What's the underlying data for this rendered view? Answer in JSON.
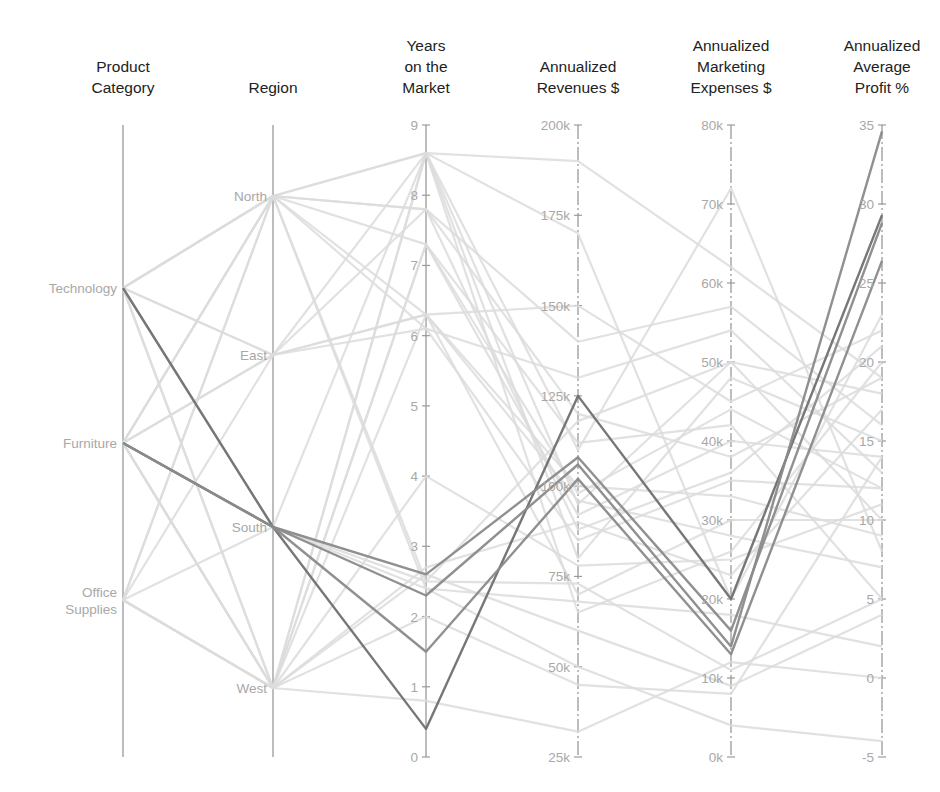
{
  "chart_data": {
    "type": "parallel_coordinates",
    "title": "",
    "axes": [
      {
        "key": "category",
        "label": "Product Category",
        "label_lines": [
          "Product",
          "Category"
        ],
        "kind": "categorical",
        "x": 123,
        "categories": [
          {
            "name": "Technology",
            "lines": [
              "Technology"
            ],
            "y": 288
          },
          {
            "name": "Furniture",
            "lines": [
              "Furniture"
            ],
            "y": 443
          },
          {
            "name": "Office Supplies",
            "lines": [
              "Office",
              "Supplies"
            ],
            "y": 600
          }
        ]
      },
      {
        "key": "region",
        "label": "Region",
        "label_lines": [
          "Region"
        ],
        "kind": "categorical",
        "x": 273,
        "categories": [
          {
            "name": "North",
            "lines": [
              "North"
            ],
            "y": 196
          },
          {
            "name": "East",
            "lines": [
              "East"
            ],
            "y": 355
          },
          {
            "name": "South",
            "lines": [
              "South"
            ],
            "y": 527
          },
          {
            "name": "West",
            "lines": [
              "West"
            ],
            "y": 688
          }
        ]
      },
      {
        "key": "years",
        "label": "Years on the Market",
        "label_lines": [
          "Years",
          "on the",
          "Market"
        ],
        "kind": "numeric",
        "x": 426,
        "range": [
          0,
          9
        ],
        "ticks": [
          {
            "v": 0,
            "t": "0"
          },
          {
            "v": 1,
            "t": "1"
          },
          {
            "v": 2,
            "t": "2"
          },
          {
            "v": 3,
            "t": "3"
          },
          {
            "v": 4,
            "t": "4"
          },
          {
            "v": 5,
            "t": "5"
          },
          {
            "v": 6,
            "t": "6"
          },
          {
            "v": 7,
            "t": "7"
          },
          {
            "v": 8,
            "t": "8"
          },
          {
            "v": 9,
            "t": "9"
          }
        ]
      },
      {
        "key": "revenue",
        "label": "Annualized Revenues $",
        "label_lines": [
          "Annualized",
          "Revenues $"
        ],
        "kind": "numeric",
        "x": 578,
        "range": [
          25000,
          200000
        ],
        "ticks": [
          {
            "v": 25000,
            "t": "25k"
          },
          {
            "v": 50000,
            "t": "50k"
          },
          {
            "v": 75000,
            "t": "75k"
          },
          {
            "v": 100000,
            "t": "100k"
          },
          {
            "v": 125000,
            "t": "125k"
          },
          {
            "v": 150000,
            "t": "150k"
          },
          {
            "v": 175000,
            "t": "175k"
          },
          {
            "v": 200000,
            "t": "200k"
          }
        ]
      },
      {
        "key": "marketing",
        "label": "Annualized Marketing Expenses $",
        "label_lines": [
          "Annualized",
          "Marketing",
          "Expenses $"
        ],
        "kind": "numeric",
        "x": 731,
        "range": [
          0,
          80000
        ],
        "ticks": [
          {
            "v": 0,
            "t": "0k"
          },
          {
            "v": 10000,
            "t": "10k"
          },
          {
            "v": 20000,
            "t": "20k"
          },
          {
            "v": 30000,
            "t": "30k"
          },
          {
            "v": 40000,
            "t": "40k"
          },
          {
            "v": 50000,
            "t": "50k"
          },
          {
            "v": 60000,
            "t": "60k"
          },
          {
            "v": 70000,
            "t": "70k"
          },
          {
            "v": 80000,
            "t": "80k"
          }
        ]
      },
      {
        "key": "profit",
        "label": "Annualized Average Profit %",
        "label_lines": [
          "Annualized",
          "Average",
          "Profit %"
        ],
        "kind": "numeric",
        "x": 882,
        "range": [
          -5,
          35
        ],
        "ticks": [
          {
            "v": -5,
            "t": "-5"
          },
          {
            "v": 0,
            "t": "0"
          },
          {
            "v": 5,
            "t": "5"
          },
          {
            "v": 10,
            "t": "10"
          },
          {
            "v": 15,
            "t": "15"
          },
          {
            "v": 20,
            "t": "20"
          },
          {
            "v": 25,
            "t": "25"
          },
          {
            "v": 30,
            "t": "30"
          },
          {
            "v": 35,
            "t": "35"
          }
        ]
      }
    ],
    "layout": {
      "plot_top": 125,
      "plot_bottom": 757,
      "grid": false,
      "legend": "none"
    },
    "colors": {
      "axis": "#9a9a9a",
      "tick_label": "#a8a8a8",
      "title": "#222222",
      "faded_line": "#dcdcdc",
      "highlight_line": "#8a8a8a",
      "highlight_strong": "#707070"
    },
    "highlighted": [
      {
        "category": "Technology",
        "region": "South",
        "years": 0.4,
        "revenue": 125000,
        "marketing": 20000,
        "profit": 29.3
      },
      {
        "category": "Furniture",
        "region": "South",
        "years": 2.6,
        "revenue": 108000,
        "marketing": 16000,
        "profit": 28.8
      },
      {
        "category": "Furniture",
        "region": "South",
        "years": 2.3,
        "revenue": 106000,
        "marketing": 14000,
        "profit": 34.6
      },
      {
        "category": "Furniture",
        "region": "South",
        "years": 1.5,
        "revenue": 102000,
        "marketing": 13000,
        "profit": 26.4
      }
    ],
    "records": [
      {
        "category": "Technology",
        "region": "North",
        "years": 8.6,
        "revenue": 95000,
        "marketing": 50000,
        "profit": 18
      },
      {
        "category": "Technology",
        "region": "North",
        "years": 7.8,
        "revenue": 140000,
        "marketing": 57000,
        "profit": 16
      },
      {
        "category": "Technology",
        "region": "East",
        "years": 6.3,
        "revenue": 150000,
        "marketing": 45000,
        "profit": 22
      },
      {
        "category": "Technology",
        "region": "West",
        "years": 7.3,
        "revenue": 92000,
        "marketing": 40000,
        "profit": 14
      },
      {
        "category": "Technology",
        "region": "North",
        "years": 6.1,
        "revenue": 85000,
        "marketing": 35000,
        "profit": 12
      },
      {
        "category": "Technology",
        "region": "South",
        "years": 8.6,
        "revenue": 110000,
        "marketing": 72000,
        "profit": 8
      },
      {
        "category": "Furniture",
        "region": "North",
        "years": 8.6,
        "revenue": 80000,
        "marketing": 48000,
        "profit": 15
      },
      {
        "category": "Furniture",
        "region": "East",
        "years": 7.8,
        "revenue": 120000,
        "marketing": 38000,
        "profit": 19
      },
      {
        "category": "Furniture",
        "region": "West",
        "years": 6.3,
        "revenue": 70000,
        "marketing": 30000,
        "profit": 10
      },
      {
        "category": "Furniture",
        "region": "West",
        "years": 8.6,
        "revenue": 65000,
        "marketing": 26000,
        "profit": 20
      },
      {
        "category": "Furniture",
        "region": "North",
        "years": 7.3,
        "revenue": 112000,
        "marketing": 42000,
        "profit": 5
      },
      {
        "category": "Furniture",
        "region": "West",
        "years": 2.7,
        "revenue": 90000,
        "marketing": 23000,
        "profit": 17
      },
      {
        "category": "Furniture",
        "region": "East",
        "years": 6.1,
        "revenue": 130000,
        "marketing": 54000,
        "profit": 13
      },
      {
        "category": "Office Supplies",
        "region": "North",
        "years": 2.5,
        "revenue": 73000,
        "marketing": 11000,
        "profit": 5
      },
      {
        "category": "Office Supplies",
        "region": "West",
        "years": 2.6,
        "revenue": 60000,
        "marketing": 9000,
        "profit": 4
      },
      {
        "category": "Office Supplies",
        "region": "South",
        "years": 2.4,
        "revenue": 50000,
        "marketing": 4000,
        "profit": -4
      },
      {
        "category": "Office Supplies",
        "region": "East",
        "years": 6.3,
        "revenue": 100000,
        "marketing": 33000,
        "profit": 9
      },
      {
        "category": "Office Supplies",
        "region": "West",
        "years": 0.8,
        "revenue": 32000,
        "marketing": 12000,
        "profit": 0
      },
      {
        "category": "Office Supplies",
        "region": "North",
        "years": 7.8,
        "revenue": 88000,
        "marketing": 36000,
        "profit": 21
      },
      {
        "category": "Office Supplies",
        "region": "West",
        "years": 4.0,
        "revenue": 78000,
        "marketing": 25000,
        "profit": 11
      },
      {
        "category": "Technology",
        "region": "West",
        "years": 8.6,
        "revenue": 190000,
        "marketing": 62000,
        "profit": 19
      },
      {
        "category": "Furniture",
        "region": "West",
        "years": 7.3,
        "revenue": 98000,
        "marketing": 44000,
        "profit": 12
      },
      {
        "category": "Technology",
        "region": "North",
        "years": 2.4,
        "revenue": 68000,
        "marketing": 18000,
        "profit": 2
      },
      {
        "category": "Furniture",
        "region": "North",
        "years": 6.3,
        "revenue": 96000,
        "marketing": 28000,
        "profit": 7
      },
      {
        "category": "Office Supplies",
        "region": "West",
        "years": 2.0,
        "revenue": 45000,
        "marketing": 8000,
        "profit": 14
      },
      {
        "category": "Technology",
        "region": "East",
        "years": 8.6,
        "revenue": 170000,
        "marketing": 20000,
        "profit": 23
      },
      {
        "category": "Furniture",
        "region": "South",
        "years": 2.5,
        "revenue": 118000,
        "marketing": 50000,
        "profit": 10
      }
    ]
  }
}
